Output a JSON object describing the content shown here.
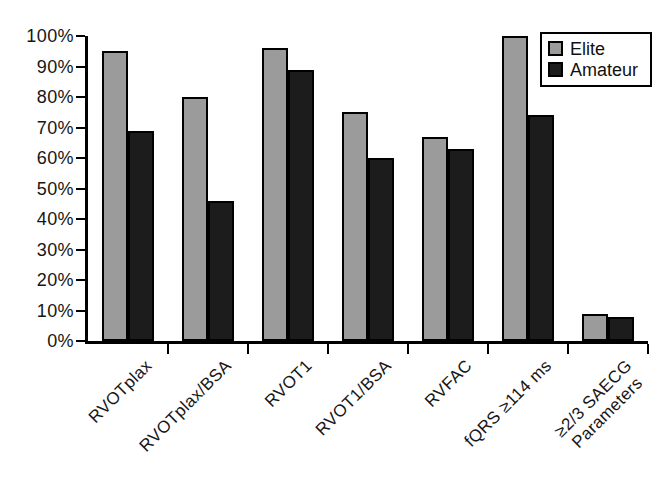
{
  "chart_data": {
    "type": "bar",
    "title": "",
    "xlabel": "",
    "ylabel": "",
    "categories": [
      "RVOTplax",
      "RVOTplax/BSA",
      "RVOT1",
      "RVOT1/BSA",
      "RVFAC",
      "fQRS ≥114 ms",
      "≥2/3 SAECG\nParameters"
    ],
    "series": [
      {
        "name": "Elite",
        "color": "#9b9b9b",
        "values": [
          95,
          80,
          96,
          75,
          67,
          100,
          9
        ]
      },
      {
        "name": "Amateur",
        "color": "#1c1c1c",
        "values": [
          69,
          46,
          89,
          60,
          63,
          74,
          8
        ]
      }
    ],
    "ylim": [
      0,
      100
    ],
    "ytick_step": 10,
    "ytick_suffix": "%",
    "ytick_labels": [
      "0%",
      "10%",
      "20%",
      "30%",
      "40%",
      "50%",
      "60%",
      "70%",
      "80%",
      "90%",
      "100%"
    ],
    "grid": false,
    "legend_position": "top-right",
    "axis_color": "#000000",
    "bar_border_color": "#000000"
  },
  "legend": {
    "items": [
      {
        "label": "Elite"
      },
      {
        "label": "Amateur"
      }
    ]
  }
}
